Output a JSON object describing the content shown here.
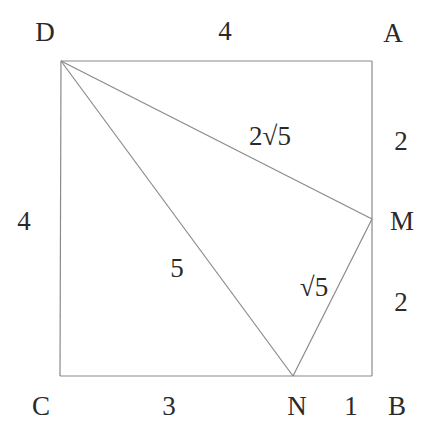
{
  "diagram": {
    "stroke_color": "#8a8a8a",
    "text_color": "#2a2a2a",
    "vertices": {
      "D": {
        "label": "D",
        "x": 61,
        "y": 61
      },
      "A": {
        "label": "A",
        "x": 372,
        "y": 61
      },
      "B": {
        "label": "B",
        "x": 372,
        "y": 376
      },
      "C": {
        "label": "C",
        "x": 60,
        "y": 376
      },
      "M": {
        "label": "M",
        "x": 372,
        "y": 219
      },
      "N": {
        "label": "N",
        "x": 293,
        "y": 376
      }
    },
    "segments": [
      {
        "from": "D",
        "to": "A"
      },
      {
        "from": "A",
        "to": "B"
      },
      {
        "from": "B",
        "to": "C"
      },
      {
        "from": "C",
        "to": "D"
      },
      {
        "from": "D",
        "to": "M"
      },
      {
        "from": "D",
        "to": "N"
      },
      {
        "from": "M",
        "to": "N"
      }
    ],
    "lengths": {
      "DA": "4",
      "DC": "4",
      "AM": "2",
      "MB": "2",
      "CN": "3",
      "NB": "1",
      "DM": "2√5",
      "DN": "5",
      "MN": "√5"
    }
  }
}
